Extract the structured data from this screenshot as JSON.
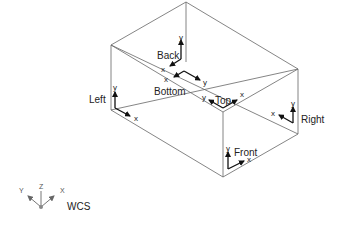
{
  "diagram": {
    "type": "isometric-box-ucs-faces",
    "faces": [
      {
        "name": "Back",
        "label": "Back",
        "x_axis": "x",
        "y_axis": "y"
      },
      {
        "name": "Bottom",
        "label": "Bottom",
        "x_axis": "x",
        "y_axis": "y"
      },
      {
        "name": "Top",
        "label": "Top",
        "x_axis": "x",
        "y_axis": "y"
      },
      {
        "name": "Left",
        "label": "Left",
        "x_axis": "x",
        "y_axis": "y"
      },
      {
        "name": "Right",
        "label": "Right",
        "x_axis": "x",
        "y_axis": "y"
      },
      {
        "name": "Front",
        "label": "Front",
        "x_axis": "x",
        "y_axis": "y"
      }
    ],
    "wcs_icon": {
      "label": "WCS",
      "axes": [
        "Y",
        "Z",
        "X"
      ]
    }
  },
  "colors": {
    "line": "#555555",
    "arrow": "#111111",
    "text": "#222222",
    "background": "#ffffff"
  }
}
